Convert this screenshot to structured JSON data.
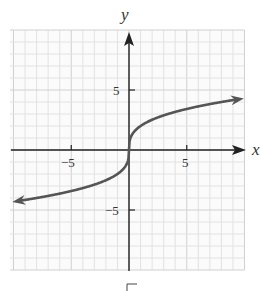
{
  "chart_data": {
    "type": "line",
    "title": "",
    "xlabel": "x",
    "ylabel": "y",
    "function": "y = 2 * cbrt(x)",
    "xlim": [
      -10.3,
      10
    ],
    "ylim": [
      -10,
      10
    ],
    "grid": true,
    "grid_step": 1,
    "major_grid_step": 5,
    "x_ticks": [
      -5,
      5
    ],
    "x_tick_labels": [
      "−5",
      "5"
    ],
    "y_ticks": [
      5,
      -5
    ],
    "y_tick_labels": [
      "5",
      "−5"
    ],
    "arrows": {
      "x_axis": "right",
      "y_axis": "up",
      "curve": "both_ends"
    },
    "series": [
      {
        "name": "curve",
        "x": [
          -10,
          -8,
          -6,
          -4,
          -2,
          -1,
          -0.5,
          -0.1,
          0,
          0.1,
          0.5,
          1,
          2,
          4,
          6,
          8,
          10
        ],
        "y": [
          -4.31,
          -4.0,
          -3.63,
          -3.17,
          -2.52,
          -2.0,
          -1.59,
          -0.93,
          0,
          0.93,
          1.59,
          2.0,
          2.52,
          3.17,
          3.63,
          4.0,
          4.31
        ]
      }
    ],
    "colors": {
      "curve": "#555555",
      "axes": "#222222",
      "grid": "#e2e2e2",
      "grid_major": "#d0d0d0"
    }
  },
  "labels": {
    "x_axis": "x",
    "y_axis": "y",
    "x_tick_neg5": "−5",
    "x_tick_pos5": "5",
    "y_tick_pos5": "5",
    "y_tick_neg5": "−5"
  },
  "footer_glyph": "√"
}
